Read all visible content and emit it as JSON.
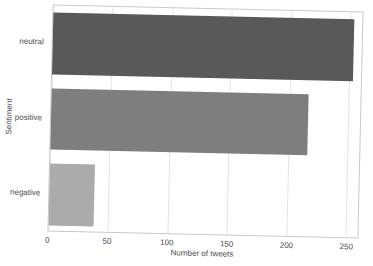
{
  "chart_data": {
    "type": "bar",
    "orientation": "horizontal",
    "categories": [
      "neutral",
      "positive",
      "negative"
    ],
    "values": [
      253,
      216,
      38
    ],
    "xlabel": "Number of tweets",
    "ylabel": "Sentiment",
    "xlim": [
      0,
      260
    ],
    "xticks": [
      0,
      50,
      100,
      150,
      200,
      250
    ],
    "grid": "vertical-gridlines-on",
    "legend": "none",
    "bar_colors": [
      "#595959",
      "#7e7e7e",
      "#ababab"
    ],
    "panel_border_color": "#c9c9c9",
    "gridline_color": "#e4e4e4",
    "text_color": "#4a4a4a",
    "background_color": "#ffffff"
  }
}
